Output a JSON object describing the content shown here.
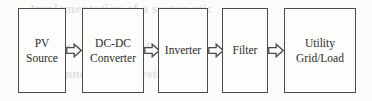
{
  "diagram": {
    "type": "block-flow-diagram",
    "background_color": "#fbfbfa",
    "stroke_color": "#4a4a4a",
    "text_color": "#2b2b2b",
    "nodes": [
      {
        "id": "pv-source",
        "label": "PV\nSource"
      },
      {
        "id": "dc-dc",
        "label": "DC-DC\nConverter"
      },
      {
        "id": "inverter",
        "label": "Inverter"
      },
      {
        "id": "filter",
        "label": "Filter"
      },
      {
        "id": "utility",
        "label": "Utility\nGrid/Load"
      }
    ],
    "connectors": [
      {
        "id": "arrow-1",
        "icon": "block-arrow-right-icon",
        "from": "pv-source",
        "to": "dc-dc"
      },
      {
        "id": "arrow-2",
        "icon": "block-arrow-right-icon",
        "from": "dc-dc",
        "to": "inverter"
      },
      {
        "id": "arrow-3",
        "icon": "block-arrow-right-icon",
        "from": "inverter",
        "to": "filter"
      },
      {
        "id": "arrow-4",
        "icon": "block-arrow-right-icon",
        "from": "filter",
        "to": "utility"
      }
    ],
    "artifacts": {
      "description": "faint bleed-through text from the reverse side of the scanned page",
      "ghost_top": "Implementation of a systematic",
      "ghost_middle": "modelling and control of a",
      "ghost_bottom": "grid connected PV system"
    }
  }
}
